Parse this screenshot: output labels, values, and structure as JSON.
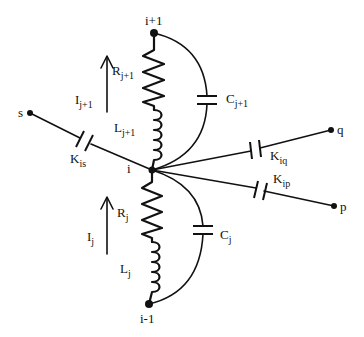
{
  "diagram": {
    "type": "circuit",
    "nodes": [
      {
        "id": "i+1",
        "label": "i+1"
      },
      {
        "id": "i",
        "label": "i"
      },
      {
        "id": "i-1",
        "label": "i-1"
      },
      {
        "id": "s",
        "label": "s"
      },
      {
        "id": "q",
        "label": "q"
      },
      {
        "id": "p",
        "label": "p"
      }
    ],
    "labels": {
      "node_ip1": "i+1",
      "node_i": "i",
      "node_im1": "i-1",
      "node_s": "s",
      "node_q": "q",
      "node_p": "p",
      "R_upper": {
        "main": "R",
        "sub": "j+1"
      },
      "L_upper": {
        "main": "L",
        "sub": "j+1"
      },
      "I_upper": {
        "main": "I",
        "sub": "j+1"
      },
      "C_upper": {
        "main": "C",
        "sub": "j+1"
      },
      "R_lower": {
        "main": "R",
        "sub": "j"
      },
      "L_lower": {
        "main": "L",
        "sub": "j"
      },
      "I_lower": {
        "main": "I",
        "sub": "j"
      },
      "C_lower": {
        "main": "C",
        "sub": "j"
      },
      "K_is": {
        "main": "K",
        "sub": "is"
      },
      "K_iq": {
        "main": "K",
        "sub": "iq"
      },
      "K_ip": {
        "main": "K",
        "sub": "ip"
      }
    },
    "edges": [
      {
        "from": "i+1",
        "to": "i",
        "components": [
          "R_{j+1}",
          "L_{j+1}"
        ],
        "parallel": "C_{j+1}",
        "current": "I_{j+1}"
      },
      {
        "from": "i",
        "to": "i-1",
        "components": [
          "R_j",
          "L_j"
        ],
        "parallel": "C_j",
        "current": "I_j"
      },
      {
        "from": "s",
        "to": "i",
        "component": "K_is"
      },
      {
        "from": "i",
        "to": "q",
        "component": "K_iq"
      },
      {
        "from": "i",
        "to": "p",
        "component": "K_ip"
      }
    ],
    "colors": {
      "ink": "#111111",
      "background": "#ffffff"
    }
  }
}
